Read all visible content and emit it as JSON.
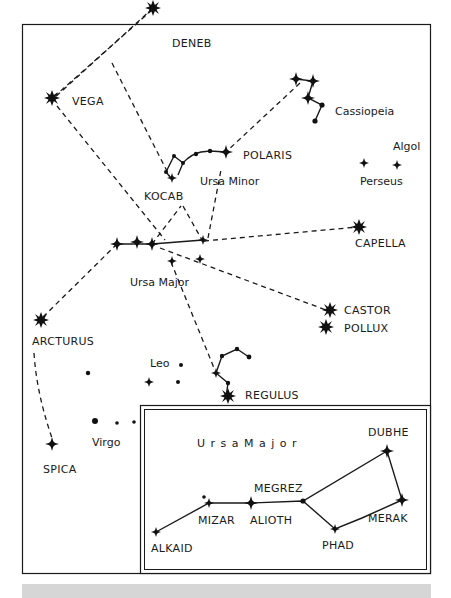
{
  "stars": {
    "deneb": "DENEB",
    "vega": "VEGA",
    "polaris": "POLARIS",
    "kocab": "KOCAB",
    "capella": "CAPELLA",
    "castor": "CASTOR",
    "pollux": "POLLUX",
    "arcturus": "ARCTURUS",
    "regulus": "REGULUS",
    "spica": "SPICA",
    "algol": "Algol"
  },
  "constellations": {
    "cassiopeia": "Cassiopeia",
    "ursa_minor": "Ursa Minor",
    "perseus": "Perseus",
    "ursa_major": "Ursa Major",
    "leo": "Leo",
    "virgo": "Virgo"
  },
  "inset": {
    "title": "U r s a   M a j o r",
    "stars": {
      "dubhe": "DUBHE",
      "merak": "MERAK",
      "phad": "PHAD",
      "megrez": "MEGREZ",
      "alioth": "ALIOTH",
      "mizar": "MIZAR",
      "alkaid": "ALKAID"
    }
  }
}
